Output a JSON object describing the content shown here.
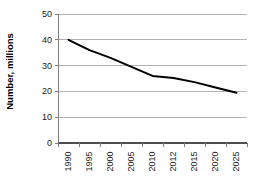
{
  "chart_data": {
    "type": "line",
    "title": "",
    "subtitle": "",
    "xlabel": "",
    "ylabel": "Number, millions",
    "categories": [
      "1990",
      "1995",
      "2000",
      "2005",
      "2010",
      "2012",
      "2015",
      "2020",
      "2025"
    ],
    "values": [
      40,
      36,
      33,
      29.5,
      26,
      25.2,
      23.6,
      21.5,
      19.5
    ],
    "series": [
      {
        "name": "Number, millions",
        "values": [
          40,
          36,
          33,
          29.5,
          26,
          25.2,
          23.6,
          21.5,
          19.5
        ]
      }
    ],
    "ylim": [
      0,
      50
    ],
    "yticks": [
      0,
      10,
      20,
      30,
      40,
      50
    ],
    "ytick_labels": [
      "0",
      "10",
      "20",
      "30",
      "40",
      "50"
    ],
    "grid": true,
    "grid_axis": "y",
    "legend": false,
    "legend_position": "none",
    "line_color": "#000000",
    "grid_color": "#b3b3b3",
    "axis_color": "#808080",
    "background": "#ffffff",
    "markers": false,
    "line_width": 2
  },
  "axis": {
    "y_title": "Number, millions"
  }
}
